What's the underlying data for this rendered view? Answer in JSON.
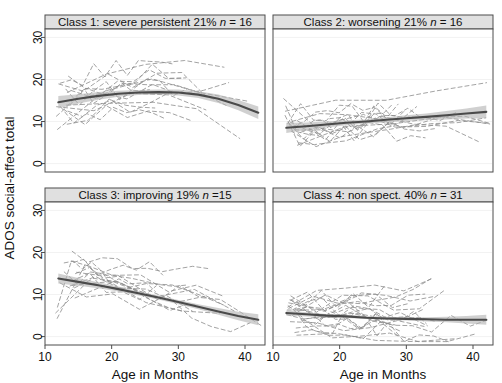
{
  "figure": {
    "xlabel": "Age in Months",
    "ylabel": "ADOS social-affect total"
  },
  "chart_data": {
    "type": "line",
    "title": "",
    "xlabel": "Age in Months",
    "ylabel": "ADOS social-affect total",
    "xlim": [
      10,
      43
    ],
    "ylim": [
      -2,
      32
    ],
    "xticks": [
      10,
      20,
      30,
      40
    ],
    "yticks": [
      0,
      10,
      20,
      30
    ],
    "grid": true,
    "legend_position": "none",
    "layout": "2x2 facet grid",
    "panels": [
      {
        "id": "class1",
        "row": 0,
        "col": 0,
        "strip_title": "Class 1: severe persistent 21% n = 16",
        "class_number": 1,
        "class_name": "severe persistent",
        "percent": "21%",
        "n_label": "n = 16",
        "n": 16,
        "trend": "inverted-u",
        "fit_x": [
          12,
          15,
          18,
          21,
          24,
          27,
          30,
          33,
          36,
          39,
          42
        ],
        "fit_y": [
          14.6,
          15.4,
          16.1,
          16.6,
          16.9,
          17.0,
          16.9,
          16.4,
          15.4,
          13.9,
          12.1
        ],
        "ci_lower": [
          13.1,
          14.3,
          15.2,
          15.9,
          16.3,
          16.4,
          16.2,
          15.6,
          14.4,
          12.7,
          10.6
        ],
        "ci_upper": [
          16.1,
          16.5,
          17.0,
          17.3,
          17.5,
          17.6,
          17.6,
          17.2,
          16.4,
          15.1,
          13.6
        ]
      },
      {
        "id": "class2",
        "row": 0,
        "col": 1,
        "strip_title": "Class 2: worsening 21% n = 16",
        "class_number": 2,
        "class_name": "worsening",
        "percent": "21%",
        "n_label": "n = 16",
        "n": 16,
        "trend": "increasing",
        "fit_x": [
          12,
          15,
          18,
          21,
          24,
          27,
          30,
          33,
          36,
          39,
          42
        ],
        "fit_y": [
          8.5,
          8.9,
          9.3,
          9.7,
          10.0,
          10.4,
          10.8,
          11.1,
          11.5,
          11.9,
          12.3
        ],
        "ci_lower": [
          7.3,
          8.0,
          8.6,
          9.1,
          9.5,
          9.8,
          10.1,
          10.3,
          10.5,
          10.7,
          10.8
        ],
        "ci_upper": [
          9.7,
          9.8,
          10.0,
          10.3,
          10.5,
          11.0,
          11.5,
          11.9,
          12.5,
          13.1,
          13.8
        ]
      },
      {
        "id": "class3",
        "row": 1,
        "col": 0,
        "strip_title": "Class 3: improving 19% n =15",
        "class_number": 3,
        "class_name": "improving",
        "percent": "19%",
        "n_label": "n =15",
        "n": 15,
        "trend": "decreasing",
        "fit_x": [
          12,
          15,
          18,
          21,
          24,
          27,
          30,
          33,
          36,
          39,
          42
        ],
        "fit_y": [
          13.8,
          13.0,
          12.2,
          11.3,
          10.3,
          9.3,
          8.2,
          7.1,
          6.0,
          4.9,
          4.0
        ],
        "ci_lower": [
          12.6,
          12.1,
          11.5,
          10.7,
          9.8,
          8.8,
          7.7,
          6.5,
          5.2,
          3.9,
          2.7
        ],
        "ci_upper": [
          15.0,
          13.9,
          12.9,
          11.9,
          10.8,
          9.8,
          8.7,
          7.7,
          6.8,
          5.9,
          5.3
        ]
      },
      {
        "id": "class4",
        "row": 1,
        "col": 1,
        "strip_title": "Class 4: non spect. 40% n = 31",
        "class_number": 4,
        "class_name": "non spect.",
        "percent": "40%",
        "n_label": "n = 31",
        "n": 31,
        "trend": "flat-low",
        "fit_x": [
          12,
          15,
          18,
          21,
          24,
          27,
          30,
          33,
          36,
          39,
          42
        ],
        "fit_y": [
          5.6,
          5.3,
          5.0,
          4.8,
          4.5,
          4.3,
          4.2,
          4.1,
          4.0,
          4.0,
          4.0
        ],
        "ci_lower": [
          5.0,
          4.8,
          4.6,
          4.4,
          4.2,
          4.0,
          3.8,
          3.6,
          3.4,
          3.1,
          2.8
        ],
        "ci_upper": [
          6.2,
          5.8,
          5.4,
          5.2,
          4.9,
          4.7,
          4.6,
          4.6,
          4.7,
          4.9,
          5.2
        ]
      }
    ]
  }
}
